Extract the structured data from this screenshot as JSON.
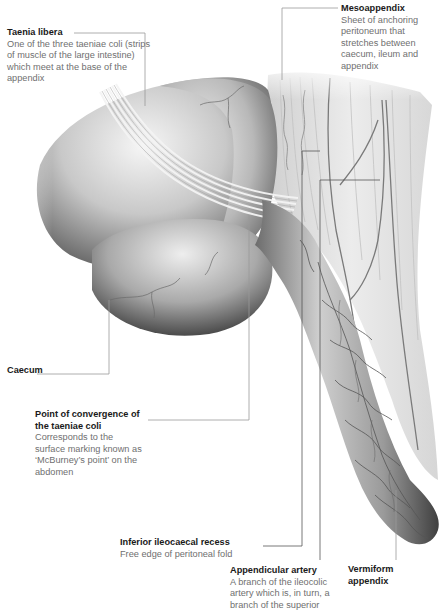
{
  "diagram": {
    "style": "greyscale medical illustration with leader-line callouts"
  },
  "labels": [
    {
      "id": "taenia-libera",
      "title": "Taenia libera",
      "description": "One of the three taeniae coli (strips of muscle of the large intestine) which meet at the base of the appendix"
    },
    {
      "id": "mesoappendix",
      "title": "Mesoappendix",
      "description": "Sheet of anchoring peritoneum that stretches between caecum, ileum and appendix"
    },
    {
      "id": "caecum",
      "title": "Caecum",
      "description": ""
    },
    {
      "id": "point-of-convergence",
      "title": "Point of convergence of the taeniae coli",
      "description": "Corresponds to the surface marking known as ‘McBurney’s point’ on the abdomen"
    },
    {
      "id": "inferior-ileocaecal-recess",
      "title": "Inferior ileocaecal recess",
      "description": "Free edge of peritoneal fold"
    },
    {
      "id": "appendicular-artery",
      "title": "Appendicular artery",
      "description": "A branch of the ileocolic artery which is, in turn, a branch of the superior"
    },
    {
      "id": "vermiform-appendix",
      "title": "Vermiform appendix",
      "description": ""
    }
  ],
  "colors": {
    "background": "#ffffff",
    "title_text": "#1a1a1a",
    "description_text": "#6f6f6f",
    "leader_line": "#9a9a9a",
    "tissue_light": "#e8e8e8",
    "tissue_mid": "#a8a8a8",
    "tissue_dark": "#4a4a4a",
    "vessel": "#5a5a5a"
  }
}
